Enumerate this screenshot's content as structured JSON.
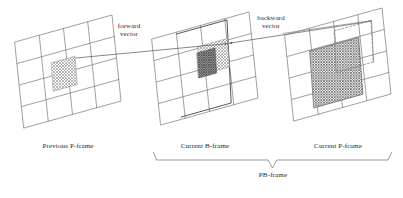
{
  "figure": {
    "type": "diagram",
    "background": "#ffffff",
    "line_color": "#555555",
    "text_color": "#2b2b2b"
  },
  "frames": [
    {
      "id": "previous-p-frame",
      "label": "Previous P-frame",
      "grid": {
        "rows": 4,
        "cols": 4
      },
      "blocks": [
        {
          "name": "reference-macroblock",
          "fill": "light-hatch"
        }
      ]
    },
    {
      "id": "current-b-frame",
      "label": "Current B-frame",
      "grid": {
        "rows": 4,
        "cols": 4
      },
      "blocks": [
        {
          "name": "b-macroblock",
          "fill": "light-hatch"
        },
        {
          "name": "b-subblock",
          "fill": "dark-hatch"
        }
      ]
    },
    {
      "id": "current-p-frame",
      "label": "Current P-frame",
      "grid": {
        "rows": 4,
        "cols": 4
      },
      "blocks": [
        {
          "name": "p-macroblock",
          "fill": "medium-hatch"
        },
        {
          "name": "p-dashed-region",
          "fill": "none",
          "stroke": "dashed"
        }
      ]
    }
  ],
  "vectors": [
    {
      "id": "forward-vector",
      "label_line1": "forward",
      "label_line2": "vector"
    },
    {
      "id": "backward-vector",
      "label_line1": "backward",
      "label_line2": "vector"
    }
  ],
  "bracket": {
    "label": "PB-frame",
    "spans": [
      "current-b-frame",
      "current-p-frame"
    ]
  }
}
